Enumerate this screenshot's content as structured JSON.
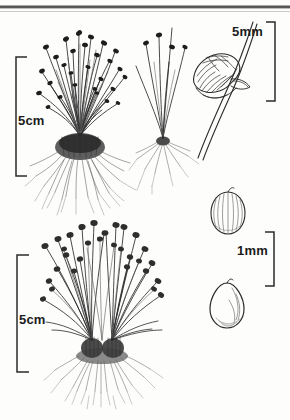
{
  "plate": {
    "kind": "botanical-line-illustration",
    "subject": "tufted sedge / spike-rush (Cyperaceae) plate",
    "background_color": "#fdfdfc",
    "ink_color": "#2b2b2b",
    "width": 290,
    "height": 420
  },
  "scale_bars": [
    {
      "id": "upper-habit-scale",
      "label": "5cm",
      "orientation": "vertical",
      "bracket_opens": "right",
      "x": 16,
      "y_top": 57,
      "y_bottom": 176
    },
    {
      "id": "lower-habit-scale",
      "label": "5cm",
      "orientation": "vertical",
      "bracket_opens": "right",
      "x": 17,
      "y_top": 255,
      "y_bottom": 372
    },
    {
      "id": "spikelet-scale",
      "label": "5mm",
      "orientation": "vertical",
      "bracket_opens": "left",
      "x": 275,
      "y_top": 22,
      "y_bottom": 101
    },
    {
      "id": "achene-scale",
      "label": "1mm",
      "orientation": "vertical",
      "bracket_opens": "left",
      "x": 274,
      "y_top": 232,
      "y_bottom": 286
    }
  ],
  "figures": [
    {
      "id": "fig-upper-habit",
      "name": "upper whole-plant tuft",
      "description": "dense tuft of many erect filiform culms topped with small dark spikelets, dark fibrous basal crown with spreading roots",
      "scale_ref": "5cm"
    },
    {
      "id": "fig-single-plant",
      "name": "single small plant",
      "description": "slender plant with about five culms bearing small dark terminal spikelets and a small fibrous root system",
      "scale_ref": "5cm"
    },
    {
      "id": "fig-spikelet",
      "name": "enlarged spikelet on culm",
      "description": "ovoid spikelet with imbricate scales borne at the tip of a stout culm",
      "scale_ref": "5mm"
    },
    {
      "id": "fig-achene-ribbed",
      "name": "ribbed achene",
      "description": "broadly ovoid longitudinally ribbed achene",
      "scale_ref": "5mm"
    },
    {
      "id": "fig-lower-habit",
      "name": "lower whole-plant tuft",
      "description": "spreading tuft of arching culms with rounded dark heads, two basal clumps with fibrous roots",
      "scale_ref": "5cm"
    },
    {
      "id": "fig-achene-ovate",
      "name": "ovate achene",
      "description": "ovate achene with an acute apex and shaded lower right margin",
      "scale_ref": "1mm"
    }
  ],
  "artifacts": {
    "top_scan_line": "dark horizontal scanning streak across the top edge of the page"
  }
}
